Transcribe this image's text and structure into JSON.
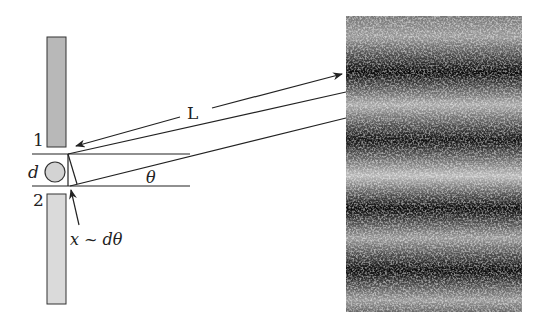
{
  "diagram": {
    "labels": {
      "slit_1": "1",
      "slit_2": "2",
      "separation": "d",
      "distance": "L",
      "angle": "θ",
      "path_difference": "x ~ dθ"
    },
    "colors": {
      "slit_upper": "#b8b8b8",
      "slit_lower": "#dadada",
      "ink": "#222222",
      "screen_dark": "#111111",
      "screen_light": "#f2f2f2"
    },
    "screen": {
      "fringe_count_bright": 4,
      "fringe_count_dark": 4
    }
  }
}
